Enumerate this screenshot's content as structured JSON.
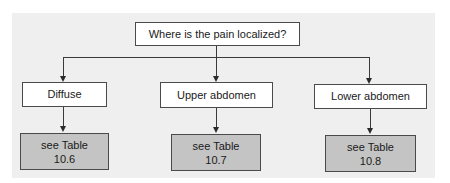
{
  "diagram": {
    "type": "decision-flowchart",
    "question": "Where is the pain localized?",
    "branches": [
      {
        "label": "Diffuse",
        "result_line1": "see Table",
        "result_line2": "10.6"
      },
      {
        "label": "Upper abdomen",
        "result_line1": "see Table",
        "result_line2": "10.7"
      },
      {
        "label": "Lower abdomen",
        "result_line1": "see Table",
        "result_line2": "10.8"
      }
    ]
  },
  "colors": {
    "panel_background": "#efefef",
    "node_background": "#ffffff",
    "result_background": "#c4c4c4",
    "line": "#3a3a3a"
  }
}
